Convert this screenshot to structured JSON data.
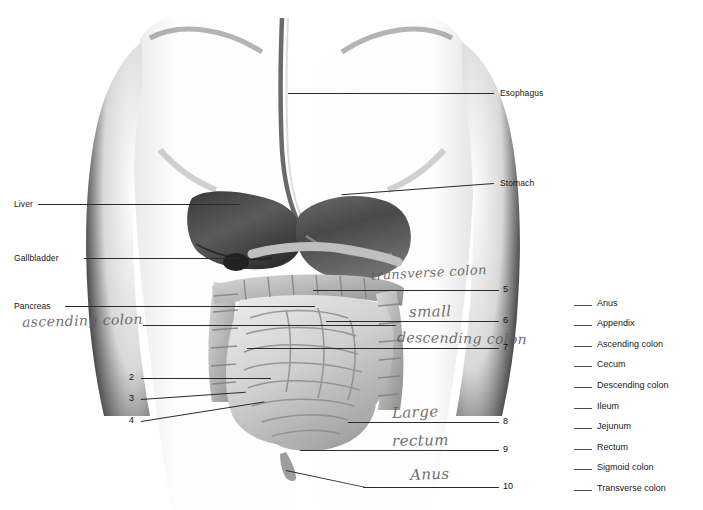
{
  "worksheet": {
    "title": "Human Digestive System Labeling Worksheet",
    "background_color": "#ffffff",
    "ink_color": "#1a1a1a",
    "handwriting_color": "#5d5d5d"
  },
  "printed_labels": [
    {
      "text": "Esophagus",
      "side": "right"
    },
    {
      "text": "Stomach",
      "side": "right"
    },
    {
      "text": "Liver",
      "side": "left"
    },
    {
      "text": "Gallbladder",
      "side": "left"
    },
    {
      "text": "Pancreas",
      "side": "left"
    }
  ],
  "numbered_callouts": [
    {
      "number": "2",
      "side": "left"
    },
    {
      "number": "3",
      "side": "left"
    },
    {
      "number": "4",
      "side": "left"
    },
    {
      "number": "5",
      "side": "right"
    },
    {
      "number": "6",
      "side": "right"
    },
    {
      "number": "7",
      "side": "right"
    },
    {
      "number": "8",
      "side": "right"
    },
    {
      "number": "9",
      "side": "right"
    },
    {
      "number": "10",
      "side": "right"
    }
  ],
  "handwritten_answers": [
    {
      "text": "ascending colon",
      "for_label": "pancreas-row-left"
    },
    {
      "text": "transverse colon",
      "for_number": "5"
    },
    {
      "text": "small",
      "for_number": "6"
    },
    {
      "text": "descending colon",
      "for_number": "7"
    },
    {
      "text": "Large",
      "for_number": "8"
    },
    {
      "text": "rectum",
      "for_number": "9"
    },
    {
      "text": "Anus",
      "for_number": "10"
    }
  ],
  "word_bank": {
    "blank_mark": "___",
    "items": [
      {
        "term": "Anus"
      },
      {
        "term": "Appendix"
      },
      {
        "term": "Ascending colon"
      },
      {
        "term": "Cecum"
      },
      {
        "term": "Descending colon"
      },
      {
        "term": "Ileum"
      },
      {
        "term": "Jejunum"
      },
      {
        "term": "Rectum"
      },
      {
        "term": "Sigmoid colon"
      },
      {
        "term": "Transverse colon"
      }
    ]
  },
  "illustration": {
    "name": "abdominal-torso-digestive-organs",
    "description": "Grayscale airbrushed anterior torso with stomach, liver, gallbladder, pancreas, small and large intestine"
  }
}
